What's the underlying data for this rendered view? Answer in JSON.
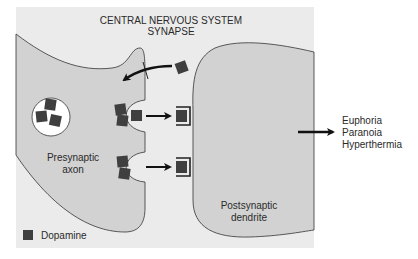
{
  "title": {
    "line1": "CENTRAL NERVOUS SYSTEM",
    "line2": "SYNAPSE"
  },
  "labels": {
    "presynaptic_line1": "Presynaptic",
    "presynaptic_line2": "axon",
    "postsynaptic_line1": "Postsynaptic",
    "postsynaptic_line2": "dendrite"
  },
  "effects": [
    "Euphoria",
    "Paranoia",
    "Hyperthermia"
  ],
  "legend": {
    "label": "Dopamine",
    "icon": "dark-square"
  },
  "colors": {
    "panel_bg": "#ebebeb",
    "cell_fill": "#d2d2d2",
    "dopamine": "#3f3f3f",
    "outline": "#333333",
    "vesicle_fill": "#ffffff"
  }
}
